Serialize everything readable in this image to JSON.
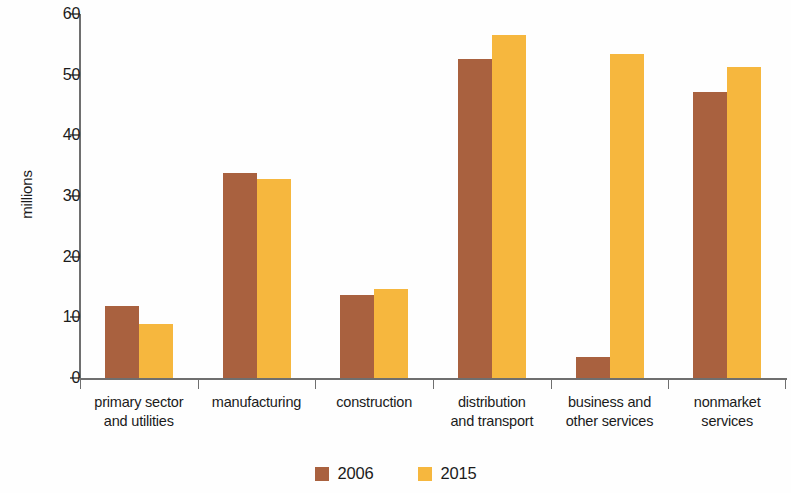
{
  "chart_data": {
    "type": "bar",
    "title": "",
    "subtitle": "",
    "xlabel": "",
    "ylabel": "millions",
    "ylim": [
      0,
      60
    ],
    "yticks": [
      0,
      10,
      20,
      30,
      40,
      50,
      60
    ],
    "grid": false,
    "legend_position": "bottom-center",
    "categories": [
      "primary sector and utilities",
      "manufacturing",
      "construction",
      "distribution and transport",
      "business and other services",
      "nonmarket services"
    ],
    "category_lines": [
      [
        "primary sector",
        "and utilities"
      ],
      [
        "manufacturing"
      ],
      [
        "construction"
      ],
      [
        "distribution",
        "and transport"
      ],
      [
        "business and",
        "other services"
      ],
      [
        "nonmarket",
        "services"
      ]
    ],
    "series": [
      {
        "name": "2006",
        "color": "#a9613f",
        "values": [
          11.9,
          33.8,
          13.7,
          52.6,
          3.4,
          47.2
        ]
      },
      {
        "name": "2015",
        "color": "#f6b73e",
        "values": [
          8.9,
          32.8,
          14.6,
          56.6,
          53.4,
          51.2
        ]
      }
    ]
  },
  "axis": {
    "y_label": "millions"
  },
  "legend": {
    "items": [
      {
        "label": "2006",
        "color": "#a9613f"
      },
      {
        "label": "2015",
        "color": "#f6b73e"
      }
    ]
  },
  "colors": {
    "series_2006": "#a9613f",
    "series_2015": "#f6b73e",
    "axis": "#6f6f6f",
    "text": "#1b1b1b",
    "background": "#ffffff"
  }
}
